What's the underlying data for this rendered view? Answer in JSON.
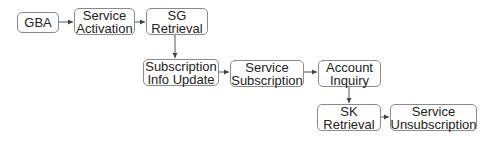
{
  "diagram": {
    "type": "flowchart",
    "nodes": [
      {
        "id": "gba",
        "label": "GBA"
      },
      {
        "id": "service_activation",
        "label": "Service\nActivation"
      },
      {
        "id": "sg_retrieval",
        "label": "SG\nRetrieval"
      },
      {
        "id": "subscription_info_update",
        "label": "Subscription\nInfo Update"
      },
      {
        "id": "service_subscription",
        "label": "Service\nSubscription"
      },
      {
        "id": "account_inquiry",
        "label": "Account\nInquiry"
      },
      {
        "id": "sk_retrieval",
        "label": "SK\nRetrieval"
      },
      {
        "id": "service_unsubscription",
        "label": "Service\nUnsubscription"
      }
    ],
    "edges": [
      {
        "from": "gba",
        "to": "service_activation"
      },
      {
        "from": "service_activation",
        "to": "sg_retrieval"
      },
      {
        "from": "sg_retrieval",
        "to": "subscription_info_update"
      },
      {
        "from": "subscription_info_update",
        "to": "service_subscription"
      },
      {
        "from": "service_subscription",
        "to": "account_inquiry"
      },
      {
        "from": "account_inquiry",
        "to": "sk_retrieval"
      },
      {
        "from": "sk_retrieval",
        "to": "service_unsubscription"
      }
    ],
    "colors": {
      "border": "#8a8a8a",
      "arrow": "#444444",
      "text": "#222222"
    }
  }
}
